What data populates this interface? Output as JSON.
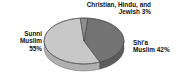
{
  "chart_data": {
    "type": "pie",
    "title": "",
    "subtitle": "",
    "xlabel": "",
    "ylabel": "",
    "legend_position": "none",
    "grid": false,
    "style": "3d-pie",
    "categories": [
      "Sunni Muslim",
      "Shi'a Muslim",
      "Christian, Hindu, and Jewish"
    ],
    "values": [
      55,
      42,
      3
    ],
    "value_unit": "%",
    "slices": [
      {
        "name": "Sunni Muslim",
        "value": 55,
        "label": "Sunni Muslim 55%",
        "color": "#c8c8c8",
        "side_color": "#b0b0b0"
      },
      {
        "name": "Shi'a Muslim",
        "value": 42,
        "label": "Shi'a Muslim 42%",
        "color": "#737373",
        "side_color": "#5d5d5d"
      },
      {
        "name": "Christian, Hindu, and Jewish",
        "value": 3,
        "label": "Christian, Hindu, and Jewish 3%",
        "color": "#8e8e8e",
        "side_color": "#7a7a7a"
      }
    ]
  },
  "labels": {
    "other": {
      "line1": "Christian, Hindu, and",
      "line2": "Jewish 3%"
    },
    "sunni": {
      "line1": "Sunni",
      "line2": "Muslim",
      "line3": "55%"
    },
    "shia": {
      "line1": "Shi'a",
      "line2": "Muslim 42%"
    }
  },
  "colors": {
    "background": "#ffffff",
    "text": "#111111",
    "slice_light": "#c8c8c8",
    "slice_dark": "#737373",
    "slice_mid": "#8e8e8e",
    "outline": "#4a4a4a"
  }
}
